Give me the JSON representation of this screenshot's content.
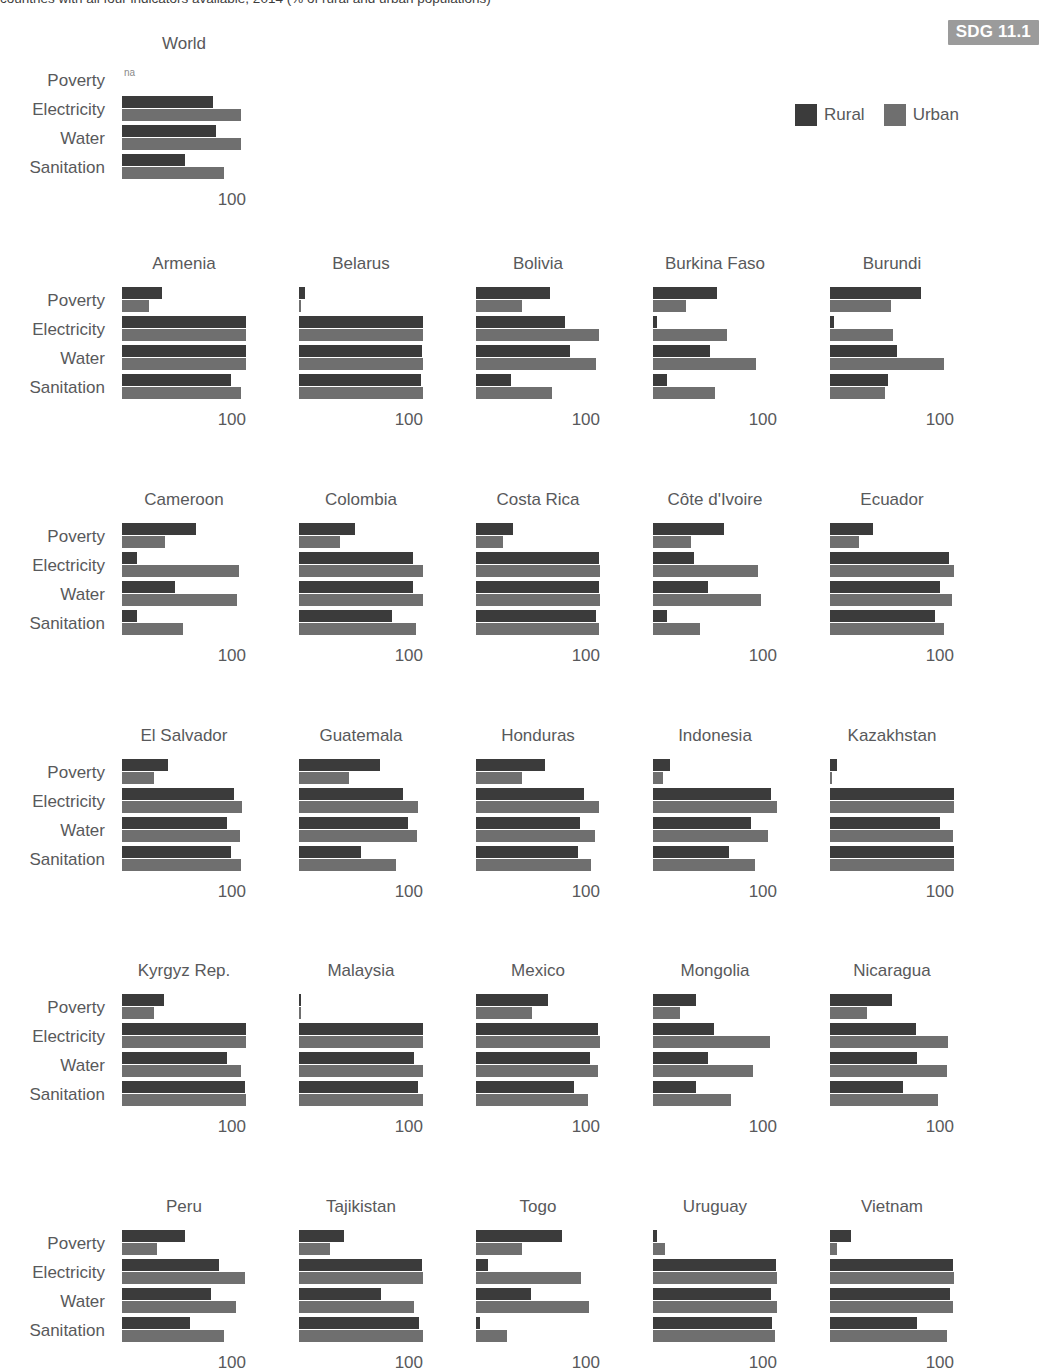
{
  "header": {
    "title": "countries with all four indicators available, 2014 (% of rural and urban populations)",
    "sdg_badge": "SDG 11.1"
  },
  "legend": {
    "items": [
      {
        "label": "Rural",
        "color": "#3b3b3b"
      },
      {
        "label": "Urban",
        "color": "#6f6f6f"
      }
    ]
  },
  "axis": {
    "tick_label": "100",
    "max": 100,
    "row_labels": [
      "Poverty",
      "Electricity",
      "Water",
      "Sanitation"
    ],
    "na_label": "na"
  },
  "chart_data": {
    "type": "bar",
    "title": "countries with all four indicators available, 2014 (% of rural and urban populations)",
    "xlabel": "",
    "ylabel": "",
    "xlim": [
      0,
      100
    ],
    "grid": false,
    "legend_position": "top-right",
    "orientation": "horizontal",
    "categories": [
      "Poverty",
      "Electricity",
      "Water",
      "Sanitation"
    ],
    "series_names": [
      "Rural",
      "Urban"
    ],
    "panels": [
      {
        "name": "World",
        "Poverty": [
          null,
          null
        ],
        "Electricity": [
          73,
          96
        ],
        "Water": [
          76,
          96
        ],
        "Sanitation": [
          51,
          82
        ]
      },
      {
        "name": "Armenia",
        "Poverty": [
          32,
          22
        ],
        "Electricity": [
          100,
          100
        ],
        "Water": [
          100,
          100
        ],
        "Sanitation": [
          88,
          96
        ]
      },
      {
        "name": "Belarus",
        "Poverty": [
          5,
          2
        ],
        "Electricity": [
          100,
          100
        ],
        "Water": [
          99,
          100
        ],
        "Sanitation": [
          98,
          100
        ]
      },
      {
        "name": "Bolivia",
        "Poverty": [
          60,
          37
        ],
        "Electricity": [
          72,
          99
        ],
        "Water": [
          76,
          97
        ],
        "Sanitation": [
          28,
          61
        ]
      },
      {
        "name": "Burkina Faso",
        "Poverty": [
          52,
          27
        ],
        "Electricity": [
          3,
          60
        ],
        "Water": [
          46,
          83
        ],
        "Sanitation": [
          11,
          50
        ]
      },
      {
        "name": "Burundi",
        "Poverty": [
          73,
          49
        ],
        "Electricity": [
          3,
          51
        ],
        "Water": [
          54,
          92
        ],
        "Sanitation": [
          47,
          44
        ]
      },
      {
        "name": "Cameroon",
        "Poverty": [
          60,
          35
        ],
        "Electricity": [
          12,
          94
        ],
        "Water": [
          43,
          93
        ],
        "Sanitation": [
          12,
          49
        ]
      },
      {
        "name": "Colombia",
        "Poverty": [
          45,
          33
        ],
        "Electricity": [
          92,
          100
        ],
        "Water": [
          92,
          100
        ],
        "Sanitation": [
          75,
          94
        ]
      },
      {
        "name": "Costa Rica",
        "Poverty": [
          30,
          22
        ],
        "Electricity": [
          99,
          100
        ],
        "Water": [
          99,
          100
        ],
        "Sanitation": [
          97,
          99
        ]
      },
      {
        "name": "Côte d'Ivoire",
        "Poverty": [
          57,
          31
        ],
        "Electricity": [
          33,
          85
        ],
        "Water": [
          44,
          87
        ],
        "Sanitation": [
          11,
          38
        ]
      },
      {
        "name": "Ecuador",
        "Poverty": [
          35,
          23
        ],
        "Electricity": [
          96,
          100
        ],
        "Water": [
          89,
          98
        ],
        "Sanitation": [
          85,
          92
        ]
      },
      {
        "name": "El Salvador",
        "Poverty": [
          37,
          26
        ],
        "Electricity": [
          90,
          97
        ],
        "Water": [
          85,
          95
        ],
        "Sanitation": [
          88,
          96
        ]
      },
      {
        "name": "Guatemala",
        "Poverty": [
          65,
          40
        ],
        "Electricity": [
          84,
          96
        ],
        "Water": [
          88,
          95
        ],
        "Sanitation": [
          50,
          78
        ]
      },
      {
        "name": "Honduras",
        "Poverty": [
          56,
          37
        ],
        "Electricity": [
          87,
          99
        ],
        "Water": [
          84,
          96
        ],
        "Sanitation": [
          82,
          93
        ]
      },
      {
        "name": "Indonesia",
        "Poverty": [
          14,
          8
        ],
        "Electricity": [
          95,
          100
        ],
        "Water": [
          79,
          93
        ],
        "Sanitation": [
          61,
          82
        ]
      },
      {
        "name": "Kazakhstan",
        "Poverty": [
          6,
          2
        ],
        "Electricity": [
          100,
          100
        ],
        "Water": [
          89,
          99
        ],
        "Sanitation": [
          100,
          100
        ]
      },
      {
        "name": "Kyrgyz Rep.",
        "Poverty": [
          34,
          26
        ],
        "Electricity": [
          100,
          100
        ],
        "Water": [
          85,
          96
        ],
        "Sanitation": [
          99,
          100
        ]
      },
      {
        "name": "Malaysia",
        "Poverty": [
          2,
          1
        ],
        "Electricity": [
          100,
          100
        ],
        "Water": [
          93,
          100
        ],
        "Sanitation": [
          96,
          100
        ]
      },
      {
        "name": "Mexico",
        "Poverty": [
          58,
          45
        ],
        "Electricity": [
          98,
          100
        ],
        "Water": [
          92,
          98
        ],
        "Sanitation": [
          79,
          90
        ]
      },
      {
        "name": "Mongolia",
        "Poverty": [
          35,
          22
        ],
        "Electricity": [
          49,
          94
        ],
        "Water": [
          44,
          81
        ],
        "Sanitation": [
          35,
          63
        ]
      },
      {
        "name": "Nicaragua",
        "Poverty": [
          50,
          30
        ],
        "Electricity": [
          69,
          95
        ],
        "Water": [
          70,
          94
        ],
        "Sanitation": [
          59,
          87
        ]
      },
      {
        "name": "Peru",
        "Poverty": [
          51,
          28
        ],
        "Electricity": [
          78,
          99
        ],
        "Water": [
          72,
          92
        ],
        "Sanitation": [
          55,
          82
        ]
      },
      {
        "name": "Tajikistan",
        "Poverty": [
          36,
          25
        ],
        "Electricity": [
          99,
          100
        ],
        "Water": [
          66,
          93
        ],
        "Sanitation": [
          97,
          100
        ]
      },
      {
        "name": "Togo",
        "Poverty": [
          69,
          37
        ],
        "Electricity": [
          10,
          85
        ],
        "Water": [
          44,
          91
        ],
        "Sanitation": [
          3,
          25
        ]
      },
      {
        "name": "Uruguay",
        "Poverty": [
          3,
          10
        ],
        "Electricity": [
          99,
          100
        ],
        "Water": [
          95,
          100
        ],
        "Sanitation": [
          96,
          98
        ]
      },
      {
        "name": "Vietnam",
        "Poverty": [
          17,
          6
        ],
        "Electricity": [
          99,
          100
        ],
        "Water": [
          97,
          99
        ],
        "Sanitation": [
          70,
          94
        ]
      }
    ]
  },
  "layout": {
    "grid_rows": [
      {
        "top": 66,
        "panels": [
          "World"
        ]
      },
      {
        "top": 286,
        "panels": [
          "Armenia",
          "Belarus",
          "Bolivia",
          "Burkina Faso",
          "Burundi"
        ]
      },
      {
        "top": 522,
        "panels": [
          "Cameroon",
          "Colombia",
          "Costa Rica",
          "Côte d'Ivoire",
          "Ecuador"
        ]
      },
      {
        "top": 758,
        "panels": [
          "El Salvador",
          "Guatemala",
          "Honduras",
          "Indonesia",
          "Kazakhstan"
        ]
      },
      {
        "top": 993,
        "panels": [
          "Kyrgyz Rep.",
          "Malaysia",
          "Mexico",
          "Mongolia",
          "Nicaragua"
        ]
      },
      {
        "top": 1229,
        "panels": [
          "Peru",
          "Tajikistan",
          "Togo",
          "Uruguay",
          "Vietnam"
        ]
      }
    ],
    "col_x": [
      122,
      299,
      476,
      653,
      830
    ],
    "panel_width": 124
  }
}
